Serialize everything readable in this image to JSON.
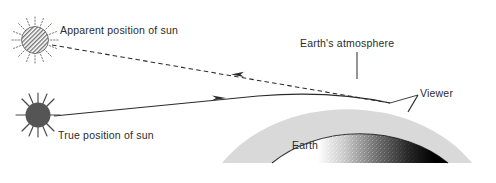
{
  "figure": {
    "width": 496,
    "height": 183,
    "background_color": "#ffffff"
  },
  "labels": {
    "apparent_sun": "Apparent position of sun",
    "true_sun": "True position of sun",
    "atmosphere": "Earth's atmosphere",
    "viewer": "Viewer",
    "earth": "Earth"
  },
  "colors": {
    "line": "#2b2b2b",
    "text": "#2b2b2b",
    "atmosphere_fill": "#d9d9d9",
    "earth_fill": "#ffffff",
    "earth_shadow": "#000000",
    "true_sun_fill": "#555555",
    "apparent_sun_fill": "#8a8a8a"
  },
  "elements": {
    "apparent_sun": {
      "name": "apparent-sun",
      "style": "hatched circle with dotted rays",
      "cx": 35,
      "cy": 40,
      "r": 14
    },
    "true_sun": {
      "name": "true-sun",
      "style": "solid dark circle with solid rays",
      "cx": 38,
      "cy": 115,
      "r": 13
    },
    "apparent_ray": {
      "name": "apparent-light-ray",
      "style": "dashed",
      "direction": "arrow points back toward apparent sun"
    },
    "true_ray": {
      "name": "true-light-ray",
      "style": "solid, refracted curve",
      "direction": "arrow points toward Earth"
    },
    "atmosphere_dome": {
      "name": "earth-atmosphere-dome",
      "style": "light gray arc band"
    },
    "earth_dome": {
      "name": "earth-dome",
      "style": "white dome with stippled dark night side"
    },
    "viewer_marker": {
      "name": "viewer-marker",
      "style": "short tick on earth surface"
    }
  }
}
